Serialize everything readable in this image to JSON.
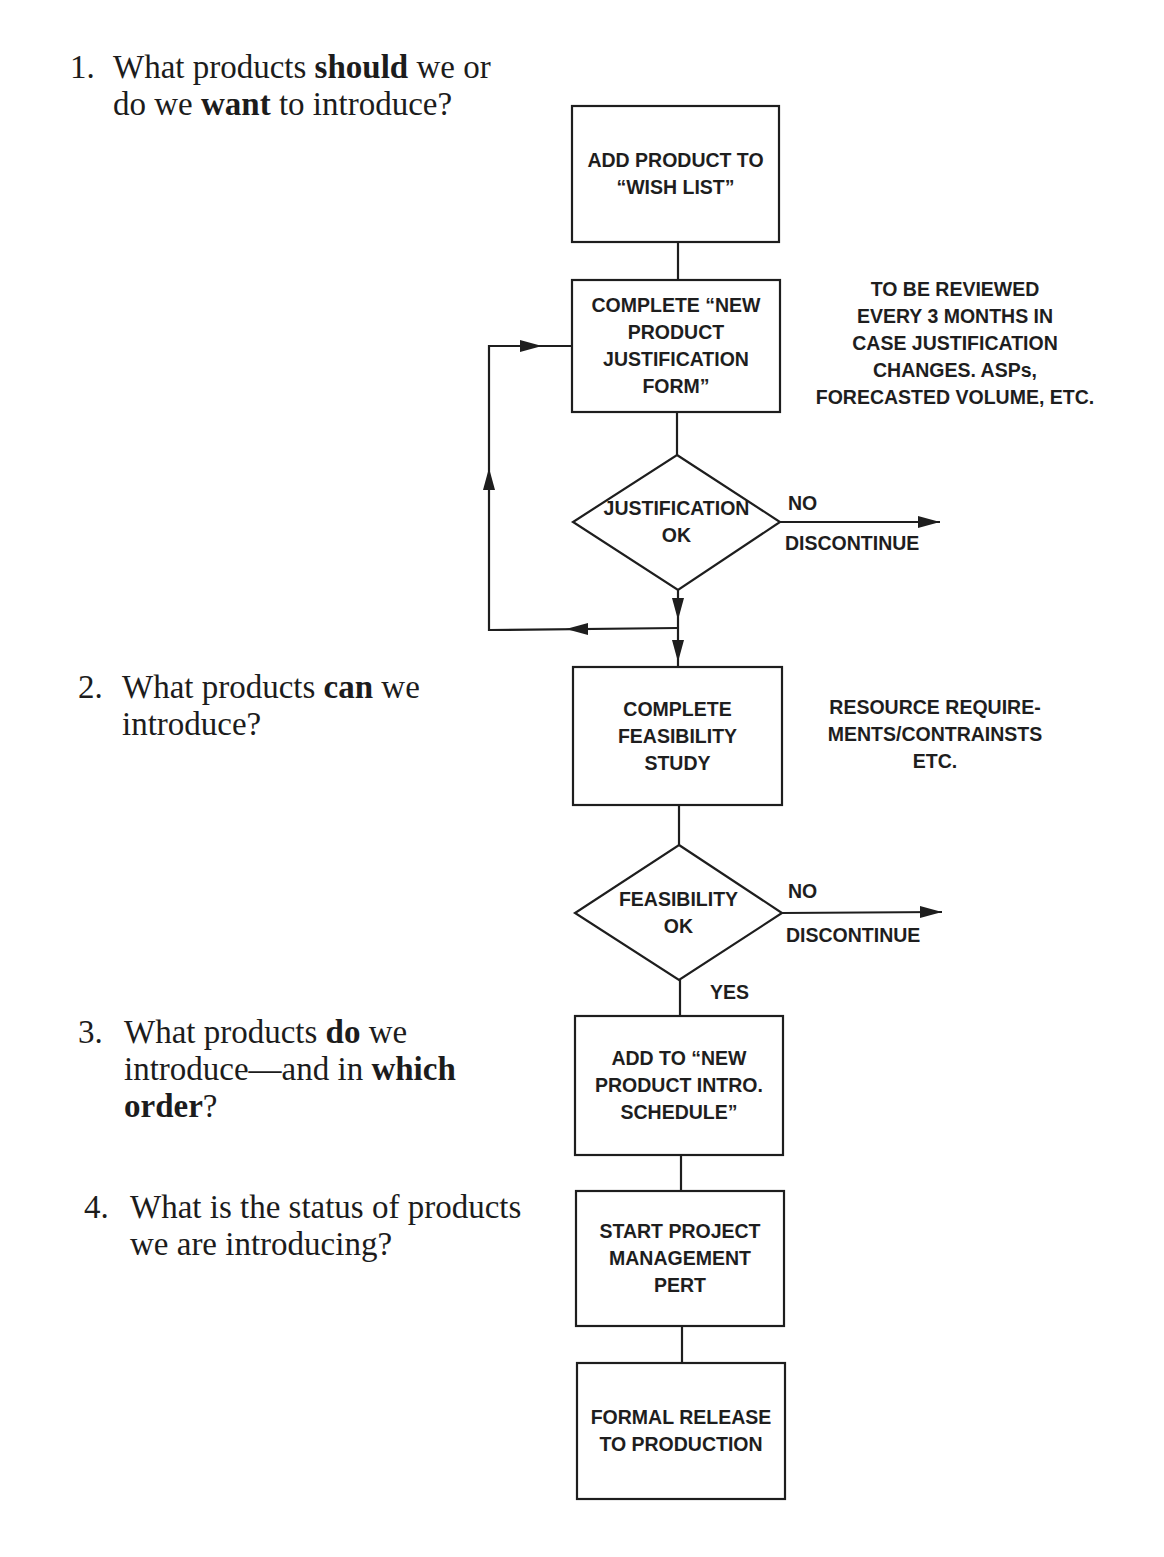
{
  "questions": [
    {
      "number": "1.",
      "segments": [
        {
          "text": "What products ",
          "bold": false
        },
        {
          "text": "should",
          "bold": true
        },
        {
          "text": " we or",
          "bold": false
        },
        {
          "text": "\n",
          "bold": false
        },
        {
          "text": "do we ",
          "bold": false
        },
        {
          "text": "want",
          "bold": true
        },
        {
          "text": " to introduce?",
          "bold": false
        }
      ]
    },
    {
      "number": "2.",
      "segments": [
        {
          "text": "What products ",
          "bold": false
        },
        {
          "text": "can",
          "bold": true
        },
        {
          "text": " we",
          "bold": false
        },
        {
          "text": "\n",
          "bold": false
        },
        {
          "text": "introduce?",
          "bold": false
        }
      ]
    },
    {
      "number": "3.",
      "segments": [
        {
          "text": "What products ",
          "bold": false
        },
        {
          "text": "do",
          "bold": true
        },
        {
          "text": " we",
          "bold": false
        },
        {
          "text": "\n",
          "bold": false
        },
        {
          "text": "introduce—and in ",
          "bold": false
        },
        {
          "text": "which",
          "bold": true
        },
        {
          "text": "\n",
          "bold": false
        },
        {
          "text": "order",
          "bold": true
        },
        {
          "text": "?",
          "bold": false
        }
      ]
    },
    {
      "number": "4.",
      "segments": [
        {
          "text": "What is the status of products",
          "bold": false
        },
        {
          "text": "\n",
          "bold": false
        },
        {
          "text": "we are introducing?",
          "bold": false
        }
      ]
    }
  ],
  "flowchart": {
    "nodes": {
      "wish_list": "ADD PRODUCT TO\n“WISH LIST”",
      "justification_form": "COMPLETE “NEW\nPRODUCT\nJUSTIFICATION\nFORM”",
      "justification_ok": "JUSTIFICATION\nOK",
      "feasibility_study": "COMPLETE\nFEASIBILITY\nSTUDY",
      "feasibility_ok": "FEASIBILITY\nOK",
      "intro_schedule": "ADD TO “NEW\nPRODUCT INTRO.\nSCHEDULE”",
      "project_management": "START PROJECT\nMANAGEMENT\nPERT",
      "formal_release": "FORMAL RELEASE\nTO PRODUCTION"
    },
    "notes": {
      "review_note": "TO BE REVIEWED\nEVERY 3 MONTHS IN\nCASE JUSTIFICATION\nCHANGES. ASPs,\nFORECASTED VOLUME, ETC.",
      "resource_note": "RESOURCE REQUIRE-\nMENTS/CONTRAINSTS\nETC."
    },
    "edge_labels": {
      "justification_no": "NO",
      "justification_discontinue": "DISCONTINUE",
      "feasibility_no": "NO",
      "feasibility_discontinue": "DISCONTINUE",
      "feasibility_yes": "YES"
    },
    "colors": {
      "line": "#1e1e1e",
      "background": "#ffffff"
    }
  }
}
